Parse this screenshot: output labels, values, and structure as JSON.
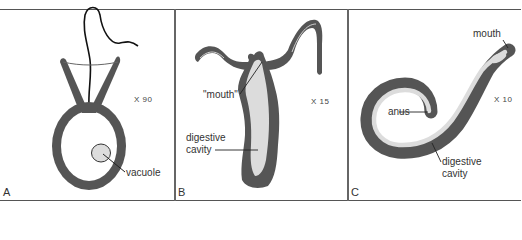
{
  "panels": [
    {
      "id": "A",
      "letter": "A",
      "magnification": "X 90",
      "labels": {
        "vacuole": "vacuole"
      }
    },
    {
      "id": "B",
      "letter": "B",
      "magnification": "X 15",
      "labels": {
        "mouth": "\"mouth\"",
        "digestive_1": "digestive",
        "digestive_2": "cavity"
      }
    },
    {
      "id": "C",
      "letter": "C",
      "magnification": "X 10",
      "labels": {
        "mouth": "mouth",
        "anus": "anus",
        "digestive_1": "digestive",
        "digestive_2": "cavity"
      }
    }
  ],
  "colors": {
    "body_wall": "#555555",
    "cavity_fill": "#dcdcdc",
    "border": "#555555"
  }
}
